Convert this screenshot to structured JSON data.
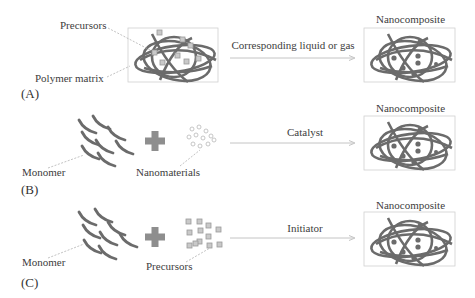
{
  "figure": {
    "panels": [
      {
        "id": "A",
        "tag": "(A)",
        "inputs": {
          "precursors_label": "Precursors",
          "matrix_label": "Polymer matrix"
        },
        "step_label": "Corresponding liquid or gas",
        "output_label": "Nanocomposite"
      },
      {
        "id": "B",
        "tag": "(B)",
        "inputs": {
          "monomer_label": "Monomer",
          "nanomaterials_label": "Nanomaterials"
        },
        "step_label": "Catalyst",
        "output_label": "Nanocomposite"
      },
      {
        "id": "C",
        "tag": "(C)",
        "inputs": {
          "monomer_label": "Monomer",
          "precursors_label": "Precursors"
        },
        "step_label": "Initiator",
        "output_label": "Nanocomposite"
      }
    ],
    "colors": {
      "chain": "#6b6b6b",
      "particle_fill": "#c9c9c9",
      "particle_stroke": "#9a9a9a",
      "dot": "#6b6b6b",
      "arrow": "#c4c4c4",
      "box": "#d0d0d0",
      "leader": "#a8a8a8",
      "plus": "#8e8e8e"
    }
  }
}
